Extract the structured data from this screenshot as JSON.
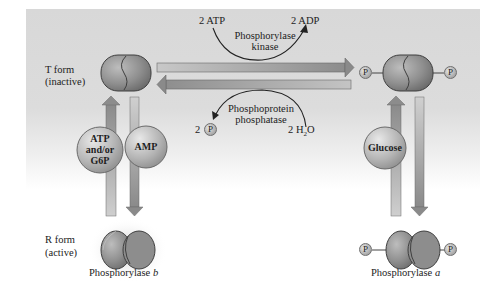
{
  "figure": {
    "background_color": "#d9d9d9",
    "arrow_color": "#9a9a9a"
  },
  "labels": {
    "t_form": "T form",
    "t_form_state": "(inactive)",
    "r_form": "R form",
    "r_form_state": "(active)",
    "phosphorylase_b": "Phosphorylase",
    "phosphorylase_b_letter": "b",
    "phosphorylase_a": "Phosphorylase",
    "phosphorylase_a_letter": "a"
  },
  "kinase_reaction": {
    "substrate": "2 ATP",
    "product": "2 ADP",
    "enzyme_line1": "Phosphorylase",
    "enzyme_line2": "kinase"
  },
  "phosphatase_reaction": {
    "substrate": "2 H",
    "substrate_sub": "2",
    "substrate_tail": "O",
    "product_count": "2",
    "product_symbol": "P",
    "enzyme_line1": "Phosphoprotein",
    "enzyme_line2": "phosphatase"
  },
  "effectors": {
    "b_inhibitor_line1": "ATP",
    "b_inhibitor_line2": "and/or",
    "b_inhibitor_line3": "G6P",
    "b_activator": "AMP",
    "a_inhibitor": "Glucose"
  },
  "phosphate_badge": "P"
}
